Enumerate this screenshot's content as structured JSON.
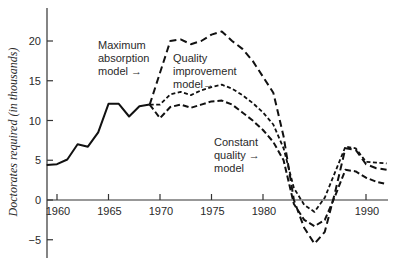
{
  "chart_data": {
    "type": "line",
    "title": "",
    "xlabel": "",
    "ylabel": "Doctorates required (in thousands)",
    "xlim": [
      1959,
      1992
    ],
    "ylim": [
      -6,
      24
    ],
    "grid": false,
    "legend": "inline annotations",
    "x_ticks": [
      1960,
      1965,
      1970,
      1975,
      1980,
      1990
    ],
    "x_tick_labels": [
      "1960",
      "1965",
      "1970",
      "1975",
      "1980",
      "1990"
    ],
    "y_ticks": [
      -5,
      0,
      5,
      10,
      15,
      20
    ],
    "y_tick_labels": [
      "−5",
      "0",
      "5",
      "10",
      "15",
      "20"
    ],
    "series": [
      {
        "name": "Historical (solid)",
        "style": "solid",
        "x": [
          1959,
          1960,
          1961,
          1962,
          1963,
          1964,
          1965,
          1966,
          1967,
          1968,
          1969
        ],
        "values": [
          4.4,
          4.5,
          5.1,
          7.0,
          6.7,
          8.5,
          12.1,
          12.1,
          10.5,
          11.8,
          12.0
        ]
      },
      {
        "name": "Maximum absorption model",
        "style": "long-dash",
        "x": [
          1969,
          1970,
          1971,
          1972,
          1973,
          1974,
          1975,
          1976,
          1977,
          1978,
          1979,
          1980,
          1981,
          1982,
          1983,
          1984,
          1985,
          1986,
          1987,
          1988,
          1989,
          1990,
          1991,
          1992
        ],
        "values": [
          12.0,
          16.0,
          20.0,
          20.2,
          19.6,
          20.0,
          20.8,
          21.2,
          20.0,
          19.0,
          17.5,
          15.5,
          13.5,
          8.0,
          0.0,
          -3.5,
          -5.5,
          -4.0,
          1.0,
          6.5,
          6.3,
          4.5,
          4.0,
          3.8
        ]
      },
      {
        "name": "Quality improvement model",
        "style": "short-dash",
        "x": [
          1969,
          1970,
          1971,
          1972,
          1973,
          1974,
          1975,
          1976,
          1977,
          1978,
          1979,
          1980,
          1981,
          1982,
          1983,
          1984,
          1985,
          1986,
          1987,
          1988,
          1989,
          1990,
          1991,
          1992
        ],
        "values": [
          12.0,
          12.0,
          13.3,
          13.6,
          13.2,
          13.8,
          14.2,
          14.5,
          14.0,
          13.2,
          12.2,
          11.0,
          9.5,
          6.5,
          1.5,
          -0.6,
          -1.5,
          0.3,
          3.5,
          6.7,
          6.5,
          4.8,
          4.7,
          4.6
        ]
      },
      {
        "name": "Constant quality model",
        "style": "medium-dash",
        "x": [
          1969,
          1970,
          1971,
          1972,
          1973,
          1974,
          1975,
          1976,
          1977,
          1978,
          1979,
          1980,
          1981,
          1982,
          1983,
          1984,
          1985,
          1986,
          1987,
          1988,
          1989,
          1990,
          1991,
          1992
        ],
        "values": [
          12.0,
          10.3,
          11.7,
          12.0,
          11.6,
          12.0,
          12.4,
          12.5,
          12.0,
          11.0,
          10.0,
          8.8,
          7.3,
          5.0,
          -0.5,
          -2.5,
          -3.3,
          -2.5,
          0.5,
          3.8,
          3.6,
          2.8,
          2.3,
          2.0
        ]
      }
    ],
    "annotations": [
      {
        "lines": [
          "Maximum",
          "absorption",
          "model →"
        ],
        "points_to": "Maximum absorption model"
      },
      {
        "lines": [
          "Quality",
          "improvement",
          "model→"
        ],
        "points_to": "Quality improvement model"
      },
      {
        "lines": [
          "Constant",
          "quality  →",
          "model"
        ],
        "points_to": "Constant quality model"
      }
    ]
  },
  "labels": {
    "ylabel": "Doctorates required (in thousands)",
    "ann_max_1": "Maximum",
    "ann_max_2": "absorption",
    "ann_max_3": "model →",
    "ann_qi_1": "Quality",
    "ann_qi_2": "improvement",
    "ann_qi_3": "model→",
    "ann_cq_1": "Constant",
    "ann_cq_2": "quality  →",
    "ann_cq_3": "model"
  },
  "colors": {
    "ink": "#111111",
    "text": "#2a2a2a",
    "background": "#ffffff"
  }
}
